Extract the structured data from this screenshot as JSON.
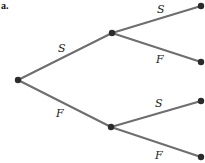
{
  "part_label": "a.",
  "colors": {
    "edge": "#6e6e6e",
    "node": "#2b2b2b",
    "text": "#222222"
  },
  "nodes": {
    "root": {
      "x": 18,
      "y": 80
    },
    "upper": {
      "x": 112,
      "y": 33
    },
    "lower": {
      "x": 111,
      "y": 127
    },
    "leaf1": {
      "x": 201,
      "y": 6
    },
    "leaf2": {
      "x": 201,
      "y": 62
    },
    "leaf3": {
      "x": 201,
      "y": 101
    },
    "leaf4": {
      "x": 201,
      "y": 157
    }
  },
  "edges": [
    {
      "from": "root",
      "to": "upper",
      "label": "S"
    },
    {
      "from": "root",
      "to": "lower",
      "label": "F"
    },
    {
      "from": "upper",
      "to": "leaf1",
      "label": "S"
    },
    {
      "from": "upper",
      "to": "leaf2",
      "label": "F"
    },
    {
      "from": "lower",
      "to": "leaf3",
      "label": "S"
    },
    {
      "from": "lower",
      "to": "leaf4",
      "label": "F"
    }
  ]
}
